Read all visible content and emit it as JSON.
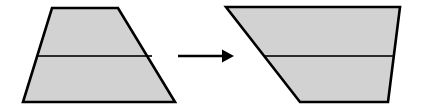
{
  "figure": {
    "background_color": "#ffffff",
    "width": 421,
    "height": 112,
    "fill_color": "#d2d2d2",
    "outline_color": "#000000",
    "divider_color": "#2b2b2b",
    "arrow_color": "#000000"
  },
  "shapes": [
    {
      "id": "left-trapezoid",
      "name": "source-trapezoid",
      "label": "",
      "description": "Trapezoid with horizontal top and bottom edges, vertical-ish left edge slanting outward to the left, and a strongly slanted right edge; divided by one horizontal line into an upper and a lower region.",
      "outline_points": "52,8 118,8 175,102 23,102",
      "divider": {
        "x1": 37,
        "y1": 56,
        "x2": 152,
        "y2": 56
      },
      "regions": [
        "upper-band",
        "lower-band"
      ]
    },
    {
      "id": "right-trapezoid",
      "name": "result-trapezoid",
      "label": "",
      "description": "Trapezoid with horizontal top and bottom edges, left edge slanting inward to the right, and right edge slanting inward; divided by one horizontal line into an upper and a lower region.",
      "outline_points": "226,7 400,7 388,102 300,102",
      "divider": {
        "x1": 264,
        "y1": 56,
        "x2": 394,
        "y2": 56
      },
      "regions": [
        "upper-band",
        "lower-band"
      ]
    }
  ],
  "arrow": {
    "id": "transform-arrow",
    "label": "",
    "direction": "right",
    "shaft": {
      "x1": 178,
      "y1": 56,
      "x2": 222,
      "y2": 56
    },
    "head_points": "222,49.5 234,56 222,62.5"
  }
}
